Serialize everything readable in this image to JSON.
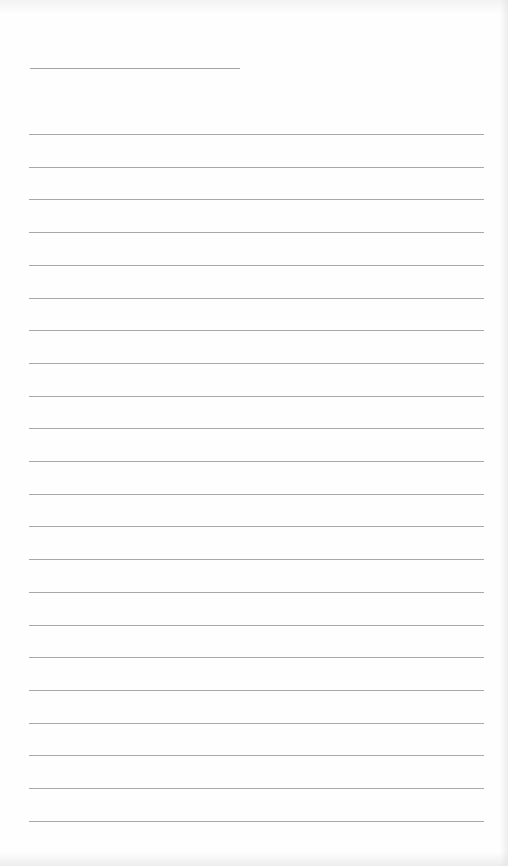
{
  "page": {
    "type": "lined-paper",
    "background_color": "#fefefe",
    "line_color": "#a8a8a8"
  },
  "title_line": {
    "text": "",
    "x": 30,
    "y": 68,
    "width": 210
  },
  "ruled_lines": {
    "count": 22,
    "start_y": 134,
    "spacing": 32.7,
    "x": 29,
    "width": 455,
    "entries": [
      "",
      "",
      "",
      "",
      "",
      "",
      "",
      "",
      "",
      "",
      "",
      "",
      "",
      "",
      "",
      "",
      "",
      "",
      "",
      "",
      "",
      ""
    ]
  }
}
